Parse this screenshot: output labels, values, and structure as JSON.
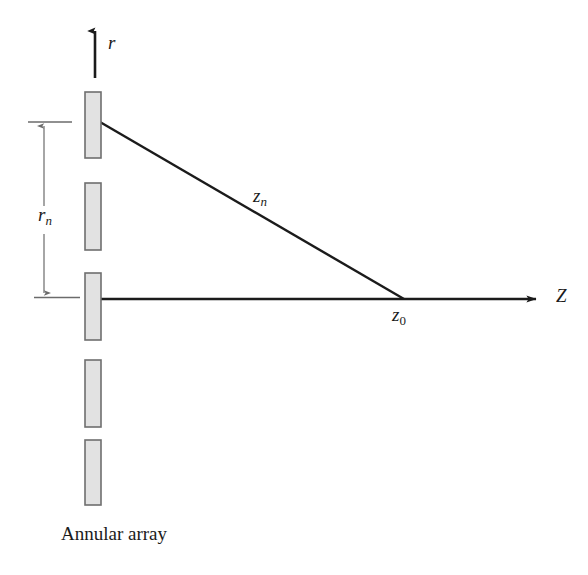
{
  "figure": {
    "kind": "annular-array-geometry-diagram",
    "caption": "Annular array",
    "background_color": "#ffffff",
    "line_color": "#1b1b1b",
    "element_fill_color": "#e2e2e2",
    "element_stroke_color": "#6f6f6f",
    "dimension_line_color": "#6b6b6b"
  },
  "axes": {
    "vertical": {
      "symbol": "r",
      "name": "radial-axis",
      "x": 95,
      "from_y": 78,
      "to_y": 28
    },
    "horizontal": {
      "symbol": "Z",
      "name": "propagation-axis",
      "y": 299,
      "from_x": 100,
      "to_x": 545
    }
  },
  "labels": {
    "r": "r",
    "r_base": "r",
    "r_sub": "n",
    "z_base": "z",
    "z_n_sub": "n",
    "z_0_sub": "0",
    "Z": "Z"
  },
  "annotations": {
    "radius": {
      "name": "r_n",
      "base": "r",
      "subscript": "n",
      "meaning": "radial distance of n-th annular element",
      "from_y": 122,
      "to_y": 297,
      "x": 44
    },
    "slant_range": {
      "name": "z_n",
      "base": "z",
      "subscript": "n",
      "meaning": "slant distance from n-th element to focus",
      "from": [
        100,
        122
      ],
      "to": [
        404,
        299
      ]
    },
    "focal_point": {
      "name": "z_0",
      "base": "z",
      "subscript": "0",
      "meaning": "geometric focus on axis",
      "x": 404,
      "y": 299
    }
  },
  "array_elements": [
    {
      "index": 1,
      "x": 85,
      "y": 92,
      "width": 16,
      "height": 66
    },
    {
      "index": 2,
      "x": 85,
      "y": 183,
      "width": 16,
      "height": 67
    },
    {
      "index": 3,
      "x": 85,
      "y": 273,
      "width": 16,
      "height": 67
    },
    {
      "index": 4,
      "x": 85,
      "y": 360,
      "width": 16,
      "height": 67
    },
    {
      "index": 5,
      "x": 85,
      "y": 440,
      "width": 16,
      "height": 65
    }
  ]
}
